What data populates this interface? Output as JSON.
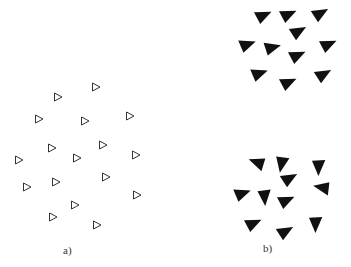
{
  "figure": {
    "panels": [
      {
        "label": "a)",
        "label_pos": [
          68,
          252
        ],
        "style": "outline",
        "triangles": [
          {
            "x": 96,
            "y": 87,
            "rot": 0
          },
          {
            "x": 58,
            "y": 97,
            "rot": 0
          },
          {
            "x": 39,
            "y": 119,
            "rot": 0
          },
          {
            "x": 85,
            "y": 121,
            "rot": 0
          },
          {
            "x": 130,
            "y": 116,
            "rot": 0
          },
          {
            "x": 52,
            "y": 148,
            "rot": 0
          },
          {
            "x": 103,
            "y": 145,
            "rot": 0
          },
          {
            "x": 19,
            "y": 160,
            "rot": 0
          },
          {
            "x": 77,
            "y": 158,
            "rot": 0
          },
          {
            "x": 136,
            "y": 155,
            "rot": 0
          },
          {
            "x": 27,
            "y": 187,
            "rot": 0
          },
          {
            "x": 56,
            "y": 182,
            "rot": 0
          },
          {
            "x": 106,
            "y": 177,
            "rot": 0
          },
          {
            "x": 137,
            "y": 195,
            "rot": 0
          },
          {
            "x": 75,
            "y": 205,
            "rot": 0
          },
          {
            "x": 53,
            "y": 217,
            "rot": 0
          },
          {
            "x": 97,
            "y": 225,
            "rot": 0
          }
        ]
      },
      {
        "label": "b)",
        "label_pos": [
          268,
          250
        ],
        "style": "filled",
        "triangles": [
          {
            "x": 263,
            "y": 15,
            "rot": -15
          },
          {
            "x": 288,
            "y": 14,
            "rot": -15
          },
          {
            "x": 320,
            "y": 13,
            "rot": -20
          },
          {
            "x": 298,
            "y": 31,
            "rot": -20
          },
          {
            "x": 247,
            "y": 44,
            "rot": -10
          },
          {
            "x": 272,
            "y": 47,
            "rot": -5
          },
          {
            "x": 328,
            "y": 44,
            "rot": -15
          },
          {
            "x": 297,
            "y": 55,
            "rot": -15
          },
          {
            "x": 259,
            "y": 73,
            "rot": -10
          },
          {
            "x": 288,
            "y": 82,
            "rot": -15
          },
          {
            "x": 323,
            "y": 74,
            "rot": -20
          },
          {
            "x": 257,
            "y": 163,
            "rot": -150
          },
          {
            "x": 282,
            "y": 164,
            "rot": 110
          },
          {
            "x": 319,
            "y": 167,
            "rot": 100
          },
          {
            "x": 289,
            "y": 178,
            "rot": -20
          },
          {
            "x": 242,
            "y": 193,
            "rot": -10
          },
          {
            "x": 265,
            "y": 197,
            "rot": 95
          },
          {
            "x": 322,
            "y": 188,
            "rot": 200
          },
          {
            "x": 286,
            "y": 200,
            "rot": -15
          },
          {
            "x": 253,
            "y": 223,
            "rot": -15
          },
          {
            "x": 285,
            "y": 231,
            "rot": -20
          },
          {
            "x": 316,
            "y": 224,
            "rot": 100
          }
        ]
      }
    ]
  }
}
